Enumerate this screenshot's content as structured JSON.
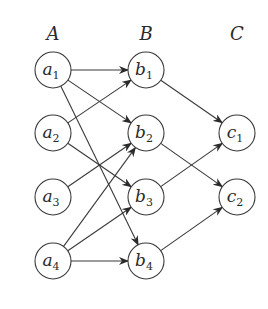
{
  "diagram": {
    "type": "layered-directed-graph",
    "columns": [
      {
        "id": "A",
        "label": "A",
        "nodes": [
          {
            "id": "a1",
            "main": "a",
            "sub": "1"
          },
          {
            "id": "a2",
            "main": "a",
            "sub": "2"
          },
          {
            "id": "a3",
            "main": "a",
            "sub": "3"
          },
          {
            "id": "a4",
            "main": "a",
            "sub": "4"
          }
        ]
      },
      {
        "id": "B",
        "label": "B",
        "nodes": [
          {
            "id": "b1",
            "main": "b",
            "sub": "1"
          },
          {
            "id": "b2",
            "main": "b",
            "sub": "2"
          },
          {
            "id": "b3",
            "main": "b",
            "sub": "3"
          },
          {
            "id": "b4",
            "main": "b",
            "sub": "4"
          }
        ]
      },
      {
        "id": "C",
        "label": "C",
        "nodes": [
          {
            "id": "c1",
            "main": "c",
            "sub": "1"
          },
          {
            "id": "c2",
            "main": "c",
            "sub": "2"
          }
        ]
      }
    ],
    "edges": [
      {
        "from": "a1",
        "to": "b1"
      },
      {
        "from": "a1",
        "to": "b2"
      },
      {
        "from": "a1",
        "to": "b4"
      },
      {
        "from": "a2",
        "to": "b1"
      },
      {
        "from": "a2",
        "to": "b3"
      },
      {
        "from": "a3",
        "to": "b2"
      },
      {
        "from": "a4",
        "to": "b2"
      },
      {
        "from": "a4",
        "to": "b3"
      },
      {
        "from": "a4",
        "to": "b4"
      },
      {
        "from": "b1",
        "to": "c1"
      },
      {
        "from": "b2",
        "to": "c2"
      },
      {
        "from": "b3",
        "to": "c1"
      },
      {
        "from": "b4",
        "to": "c2"
      }
    ]
  }
}
